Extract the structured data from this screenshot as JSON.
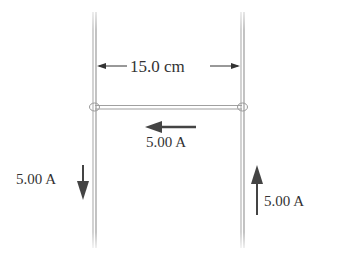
{
  "diagram": {
    "separation_label": "15.0 cm",
    "bar_current_label": "5.00 A",
    "left_current_label": "5.00 A",
    "right_current_label": "5.00 A",
    "colors": {
      "rail": "#a8a8a8",
      "arrow": "#404040",
      "text": "#333333"
    }
  }
}
